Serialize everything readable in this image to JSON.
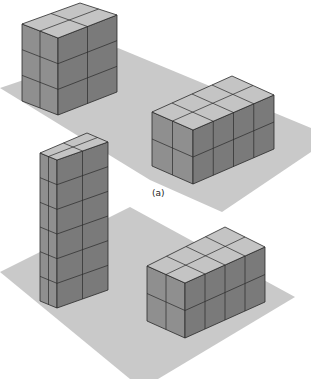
{
  "figure": {
    "label": "(a)",
    "colors": {
      "background": "#ffffff",
      "ground_plane": "#c9c9c9",
      "top_face": "#c4c4c4",
      "left_face": "#8f8f8f",
      "right_face": "#7a7a7a",
      "edge": "#2a2a2a"
    },
    "planes": [
      {
        "name": "upper-ground-plane",
        "points": "0,88 118,48 311,128 311,152 222,212 150,180"
      },
      {
        "name": "lower-ground-plane",
        "points": "0,272 130,207 295,297 158,379 130,379"
      }
    ],
    "blocks": [
      {
        "name": "upper-left-block",
        "cols_left": 2,
        "cols_right": 2,
        "layers": 3,
        "top": [
          80,
          3
        ],
        "left": [
          22,
          24
        ],
        "front": [
          58,
          38
        ],
        "right": [
          117,
          15
        ],
        "height": 77
      },
      {
        "name": "upper-right-block",
        "cols_left": 2,
        "cols_right": 4,
        "layers": 2,
        "top": [
          232,
          76
        ],
        "left": [
          152,
          112
        ],
        "front": [
          193,
          130
        ],
        "right": [
          274,
          95
        ],
        "height": 54
      },
      {
        "name": "lower-left-tower",
        "cols_left": 2,
        "cols_right": 2,
        "layers": 6,
        "top": [
          87,
          133
        ],
        "left": [
          40,
          153
        ],
        "front": [
          57,
          160
        ],
        "right": [
          108,
          142
        ],
        "height": 148
      },
      {
        "name": "lower-right-block",
        "cols_left": 2,
        "cols_right": 4,
        "layers": 2,
        "top": [
          225,
          227
        ],
        "left": [
          147,
          266
        ],
        "front": [
          185,
          283
        ],
        "right": [
          265,
          247
        ],
        "height": 55
      }
    ],
    "label_position": [
      152,
      196
    ]
  }
}
